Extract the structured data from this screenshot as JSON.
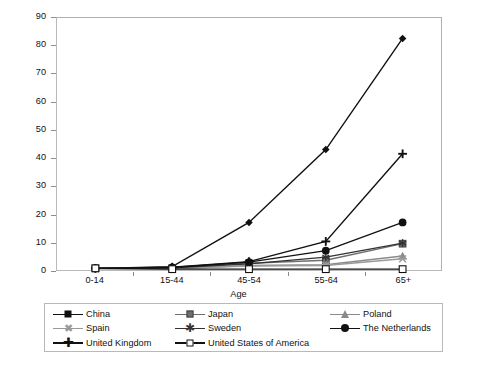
{
  "chart_data": {
    "type": "line",
    "title": "",
    "xlabel": "Age",
    "ylabel": "New cases per 100,000 person-years",
    "categories": [
      "0-14",
      "15-44",
      "45-54",
      "55-64",
      "65+"
    ],
    "ylim": [
      0,
      90
    ],
    "yticks": [
      0,
      10,
      20,
      30,
      40,
      50,
      60,
      70,
      80,
      90
    ],
    "grid": false,
    "legend_position": "bottom",
    "series": [
      {
        "name": "China",
        "marker": "diamond-filled",
        "color": "#111111",
        "values": [
          0.6,
          1.2,
          17.0,
          43.0,
          82.7
        ]
      },
      {
        "name": "Japan",
        "marker": "square-filled",
        "color": "#6e6e6e",
        "values": [
          0.6,
          0.7,
          2.4,
          3.5,
          9.4
        ]
      },
      {
        "name": "Poland",
        "marker": "triangle",
        "color": "#8a8a8a",
        "values": [
          0.5,
          0.4,
          1.6,
          1.9,
          5.0
        ]
      },
      {
        "name": "Spain",
        "marker": "x",
        "color": "#9a9a9a",
        "values": [
          0.5,
          0.5,
          1.4,
          1.6,
          4.0
        ]
      },
      {
        "name": "Sweden",
        "marker": "asterisk",
        "color": "#333333",
        "values": [
          0.6,
          0.8,
          2.2,
          4.6,
          9.6
        ]
      },
      {
        "name": "The Netherlands",
        "marker": "circle-filled",
        "color": "#111111",
        "values": [
          0.6,
          0.9,
          2.8,
          6.9,
          17.0
        ]
      },
      {
        "name": "United Kingdom",
        "marker": "plus",
        "color": "#111111",
        "values": [
          0.6,
          1.0,
          3.0,
          10.2,
          41.5
        ]
      },
      {
        "name": "United States of America",
        "marker": "square-open",
        "color": "#111111",
        "values": [
          0.6,
          0.3,
          0.3,
          0.3,
          0.3
        ]
      }
    ]
  },
  "legend": {
    "items": [
      {
        "label": "China",
        "marker": "diamond-filled"
      },
      {
        "label": "Japan",
        "marker": "square-filled"
      },
      {
        "label": "Poland",
        "marker": "triangle"
      },
      {
        "label": "Spain",
        "marker": "x"
      },
      {
        "label": "Sweden",
        "marker": "asterisk"
      },
      {
        "label": "The Netherlands",
        "marker": "circle-filled"
      },
      {
        "label": "United Kingdom",
        "marker": "plus"
      },
      {
        "label": "United States of America",
        "marker": "square-open"
      }
    ]
  },
  "colors": {
    "axis": "#8d8d8d",
    "frame": "#b9b9b9",
    "text": "#111111",
    "background": "#ffffff"
  }
}
